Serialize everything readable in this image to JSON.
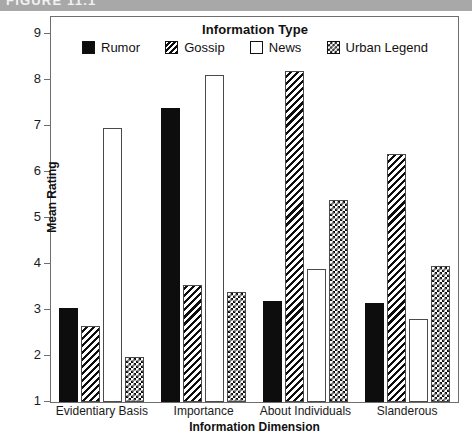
{
  "banner": {
    "text": "FIGURE 11.1"
  },
  "chart_data": {
    "type": "bar",
    "title": "",
    "legend_title": "Information Type",
    "legend_position": "top-inside",
    "xlabel": "Information Dimension",
    "ylabel": "Mean Rating",
    "ylim": [
      1,
      9
    ],
    "yticks": [
      1,
      2,
      3,
      4,
      5,
      6,
      7,
      8,
      9
    ],
    "ytick_labels": [
      "1",
      "2",
      "3",
      "4",
      "5",
      "6",
      "7",
      "8",
      "9"
    ],
    "grid": false,
    "categories": [
      "Evidentiary Basis",
      "Importance",
      "About Individuals",
      "Slanderous"
    ],
    "series": [
      {
        "name": "Rumor",
        "pattern": "solid",
        "values": [
          3.05,
          7.4,
          3.2,
          3.15
        ]
      },
      {
        "name": "Gossip",
        "pattern": "diagonal-hatch",
        "values": [
          2.65,
          3.55,
          8.2,
          6.4
        ]
      },
      {
        "name": "News",
        "pattern": "open",
        "values": [
          6.95,
          8.1,
          3.9,
          2.8
        ]
      },
      {
        "name": "Urban Legend",
        "pattern": "checkerboard",
        "values": [
          1.98,
          3.4,
          5.4,
          3.95
        ]
      }
    ]
  },
  "colors": {
    "ink": "#0d0d0d",
    "frame": "#6e6e6e",
    "banner_bg": "#a8a8a8",
    "background": "#ffffff"
  }
}
